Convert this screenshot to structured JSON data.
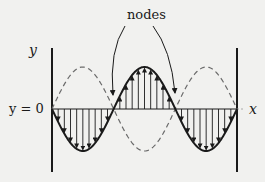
{
  "diagram": {
    "labels": {
      "nodes": "nodes",
      "y_axis": "y",
      "equilibrium": "y = 0",
      "x_axis": "x"
    },
    "geometry": {
      "left_wall_x": 52,
      "right_wall_x": 237,
      "wall_top": 48,
      "wall_bottom": 172,
      "axis_y": 109,
      "amplitude": 42,
      "node_x": [
        52,
        113,
        175,
        237
      ],
      "arrows_per_lobe": 9
    },
    "curves": [
      {
        "name": "current-displacement",
        "style": "solid",
        "lobes": [
          "down",
          "up",
          "down"
        ]
      },
      {
        "name": "half-period-displacement",
        "style": "dashed",
        "lobes": [
          "up",
          "down",
          "up"
        ]
      }
    ],
    "node_pointers": [
      {
        "from": [
          125,
          26
        ],
        "to": [
          113,
          95
        ]
      },
      {
        "from": [
          153,
          26
        ],
        "to": [
          175,
          93
        ]
      }
    ],
    "colors": {
      "background": "#f1f1ef",
      "ink": "#1a1a1a",
      "dashed": "#6b6b6b"
    }
  }
}
